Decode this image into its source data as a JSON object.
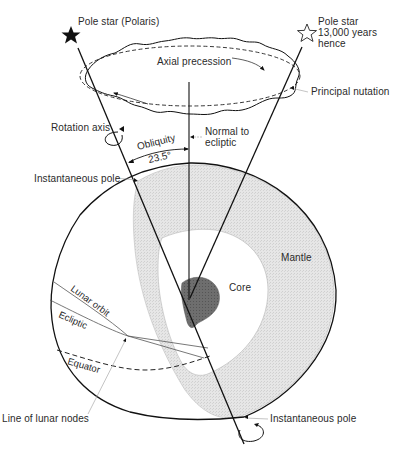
{
  "diagram": {
    "labels": {
      "pole_star_now": "Pole star (Polaris)",
      "pole_star_future_1": "Pole star",
      "pole_star_future_2": "13,000 years",
      "pole_star_future_3": "hence",
      "axial_precession": "Axial precession",
      "principal_nutation": "Principal nutation",
      "rotation_axis": "Rotation axis",
      "normal_to_ecliptic_1": "Normal to",
      "normal_to_ecliptic_2": "ecliptic",
      "obliquity": "Obliquity",
      "obliquity_value": "23.5°",
      "instantaneous_pole_top": "Instantaneous pole",
      "mantle": "Mantle",
      "core": "Core",
      "lunar_orbit": "Lunar orbit",
      "ecliptic": "Ecliptic",
      "equator": "Equator",
      "line_of_lunar_nodes": "Line of lunar nodes",
      "instantaneous_pole_bottom": "Instantaneous pole"
    },
    "icons": {
      "current_pole_star": "filled-star-icon",
      "future_pole_star": "outline-star-icon"
    },
    "colors": {
      "line": "#111111",
      "mantle_fill": "#e4e4e4",
      "core_fill": "#6a6a6a",
      "leader": "#9a9a9a",
      "text": "#2a2a2a"
    }
  }
}
